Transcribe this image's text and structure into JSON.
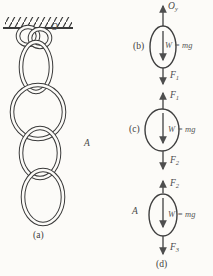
{
  "colors": {
    "background": "#fcfbf8",
    "ink": "#3a3a3a",
    "arrow_ink": "#4e4e4e"
  },
  "panel_a": {
    "label": "(a)",
    "hang_point_label": "O",
    "link_a_label": "A"
  },
  "panel_b": {
    "label": "(b)",
    "top_force_main": "O",
    "top_force_sub": "y",
    "weight_label": "W = mg",
    "bottom_force_main": "F",
    "bottom_force_sub": "1"
  },
  "panel_c": {
    "label": "(c)",
    "top_force_main": "F",
    "top_force_sub": "1",
    "weight_label": "W = mg",
    "bottom_force_main": "F",
    "bottom_force_sub": "2"
  },
  "panel_d": {
    "label": "(d)",
    "link_label": "A",
    "top_force_main": "F",
    "top_force_sub": "2",
    "weight_label": "W = mg",
    "bottom_force_main": "F",
    "bottom_force_sub": "3"
  }
}
